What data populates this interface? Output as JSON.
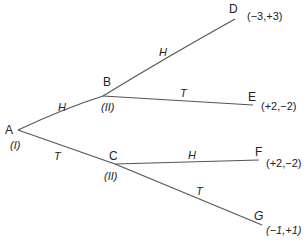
{
  "diagram": {
    "type": "game-tree",
    "nodes": [
      {
        "id": "A",
        "label": "A",
        "player": "(I)"
      },
      {
        "id": "B",
        "label": "B",
        "player": "(II)"
      },
      {
        "id": "C",
        "label": "C",
        "player": "(II)"
      },
      {
        "id": "D",
        "label": "D",
        "payoff": "(−3,+3)"
      },
      {
        "id": "E",
        "label": "E",
        "payoff": "(+2,−2)"
      },
      {
        "id": "F",
        "label": "F",
        "payoff": "(+2,−2)"
      },
      {
        "id": "G",
        "label": "G",
        "payoff": "(−1,+1)"
      }
    ],
    "edges": [
      {
        "from": "A",
        "to": "B",
        "label": "H"
      },
      {
        "from": "A",
        "to": "C",
        "label": "T"
      },
      {
        "from": "B",
        "to": "D",
        "label": "H"
      },
      {
        "from": "B",
        "to": "E",
        "label": "T"
      },
      {
        "from": "C",
        "to": "F",
        "label": "H"
      },
      {
        "from": "C",
        "to": "G",
        "label": "T"
      }
    ],
    "line_color": "#555555"
  }
}
